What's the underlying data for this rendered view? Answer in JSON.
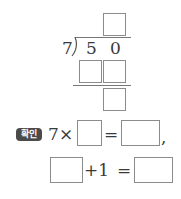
{
  "division": {
    "divisor": "7",
    "dividend_digits": [
      "5",
      "0"
    ],
    "quotient_box": "",
    "product_boxes": [
      "",
      ""
    ],
    "remainder_box": ""
  },
  "check": {
    "badge_label": "확인",
    "line1": {
      "left_operand": "7",
      "times_sign": "×",
      "box_a": "",
      "equals_sign": "=",
      "box_b": "",
      "comma": ","
    },
    "line2": {
      "box_c": "",
      "plus_one": "+1",
      "equals_sign": "=",
      "box_d": ""
    }
  },
  "colors": {
    "box_border": "#8c8c8c",
    "badge_bg": "#4a4a4a",
    "text": "#3a3a3a"
  }
}
